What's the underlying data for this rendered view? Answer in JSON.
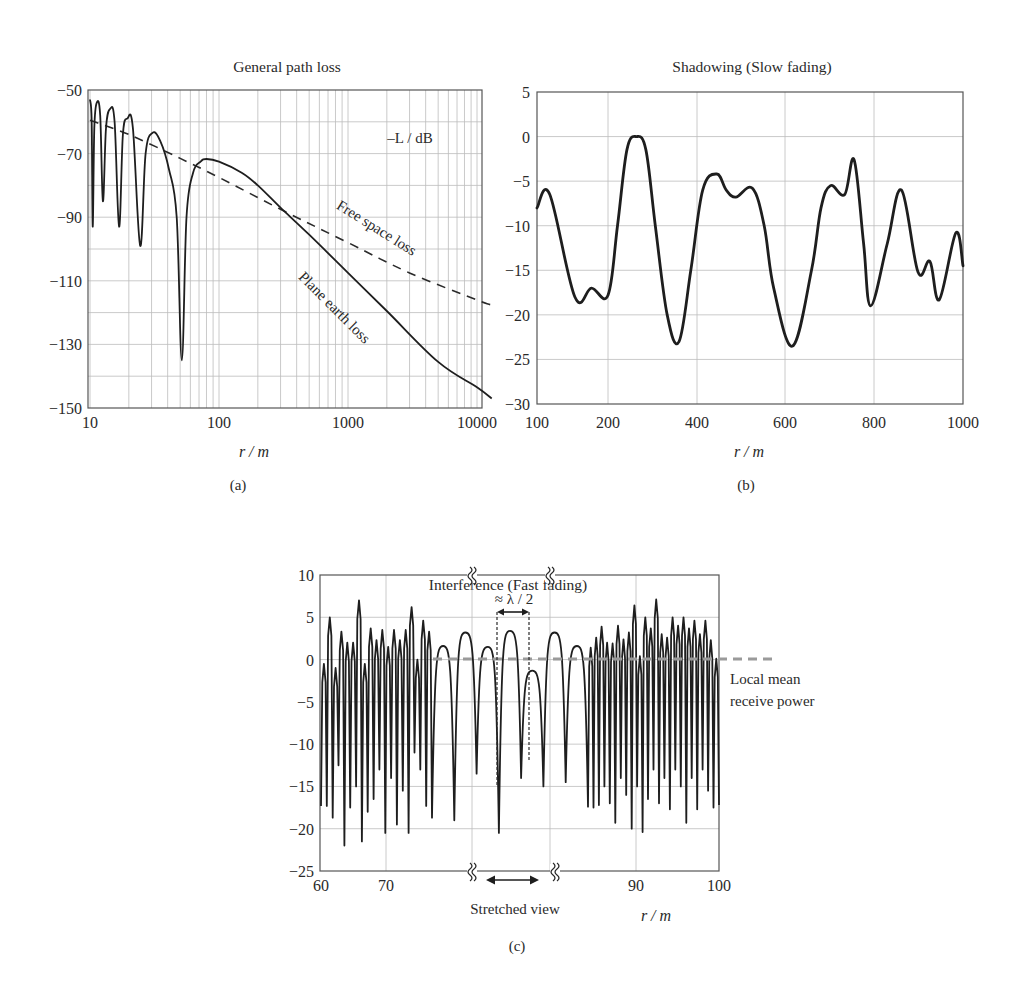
{
  "figure": {
    "panels": [
      "(a)",
      "(b)",
      "(c)"
    ]
  },
  "panel_a": {
    "title": "General path loss",
    "ylabel_annot": "–L / dB",
    "xlabel": "r / m",
    "caption": "(a)",
    "yticks": [
      "−50",
      "−70",
      "−90",
      "−110",
      "−130",
      "−150"
    ],
    "xticks": [
      "10",
      "100",
      "1000",
      "10000"
    ],
    "label_free_space": "Free space loss",
    "label_plane_earth": "Plane earth loss"
  },
  "panel_b": {
    "title": "Shadowing (Slow fading)",
    "xlabel": "r / m",
    "caption": "(b)",
    "yticks": [
      "5",
      "0",
      "−5",
      "−10",
      "−15",
      "−20",
      "−25",
      "−30"
    ],
    "xticks": [
      "100",
      "200",
      "400",
      "600",
      "800",
      "1000"
    ]
  },
  "panel_c": {
    "title": "Interference (Fast fading)",
    "xlabel": "r / m",
    "caption": "(c)",
    "yticks": [
      "10",
      "5",
      "0",
      "−5",
      "−10",
      "−15",
      "−20",
      "−25"
    ],
    "xticks": [
      "60",
      "70",
      "90",
      "100"
    ],
    "lambda_label": "≈ λ / 2",
    "mean_label_line1": "Local mean",
    "mean_label_line2": "receive power",
    "stretched_label": "Stretched view",
    "break_glyph": "≈"
  },
  "chart_data": [
    {
      "type": "line",
      "title": "General path loss",
      "xlabel": "r / m",
      "ylabel": "–L / dB",
      "xscale": "log",
      "xlim": [
        10,
        13000
      ],
      "ylim": [
        -150,
        -50
      ],
      "grid": true,
      "xticks": [
        10,
        100,
        1000,
        10000
      ],
      "yticks": [
        -50,
        -70,
        -90,
        -110,
        -130,
        -150
      ],
      "series": [
        {
          "name": "Plane earth loss",
          "style": "solid",
          "points": [
            [
              10.0,
              -53
            ],
            [
              10.3,
              -60
            ],
            [
              10.5,
              -93
            ],
            [
              10.8,
              -62
            ],
            [
              11.3,
              -54
            ],
            [
              12.0,
              -58
            ],
            [
              12.6,
              -85
            ],
            [
              13.3,
              -62
            ],
            [
              14.3,
              -56
            ],
            [
              15.5,
              -60
            ],
            [
              16.8,
              -93
            ],
            [
              18.0,
              -64
            ],
            [
              19.5,
              -59
            ],
            [
              21.5,
              -62
            ],
            [
              24.5,
              -99
            ],
            [
              27.0,
              -70
            ],
            [
              30.5,
              -63.5
            ],
            [
              35,
              -66
            ],
            [
              41,
              -75
            ],
            [
              47,
              -90
            ],
            [
              51.5,
              -135
            ],
            [
              56,
              -90
            ],
            [
              63,
              -76
            ],
            [
              72,
              -72.5
            ],
            [
              80,
              -71.7
            ],
            [
              100,
              -72.5
            ],
            [
              150,
              -76
            ],
            [
              200,
              -80
            ],
            [
              300,
              -87
            ],
            [
              500,
              -95.5
            ],
            [
              1000,
              -107.5
            ],
            [
              2000,
              -119.5
            ],
            [
              5000,
              -135.5
            ],
            [
              10000,
              -143.5
            ],
            [
              13000,
              -147
            ]
          ]
        },
        {
          "name": "Free space loss",
          "style": "dashed",
          "points": [
            [
              10,
              -59.5
            ],
            [
              20,
              -64
            ],
            [
              50,
              -71.5
            ],
            [
              100,
              -77.5
            ],
            [
              300,
              -87.5
            ],
            [
              1000,
              -98
            ],
            [
              3000,
              -107.5
            ],
            [
              10000,
              -116
            ],
            [
              13000,
              -117.6
            ]
          ]
        }
      ],
      "annotations": [
        "–L / dB",
        "Free space loss",
        "Plane earth loss"
      ]
    },
    {
      "type": "line",
      "title": "Shadowing (Slow fading)",
      "xlabel": "r / m",
      "ylabel": "",
      "xlim": [
        100,
        1000
      ],
      "ylim": [
        -30,
        5
      ],
      "grid": true,
      "xticks": [
        100,
        200,
        400,
        600,
        800,
        1000
      ],
      "yticks": [
        5,
        0,
        -5,
        -10,
        -15,
        -20,
        -25,
        -30
      ],
      "series": [
        {
          "name": "shadowing",
          "points": [
            [
              100,
              -8
            ],
            [
              127,
              -6.5
            ],
            [
              180,
              -18
            ],
            [
              215,
              -17
            ],
            [
              250,
              -17.8
            ],
            [
              270,
              -10
            ],
            [
              290,
              -1.5
            ],
            [
              310,
              0
            ],
            [
              330,
              -1.5
            ],
            [
              350,
              -10
            ],
            [
              375,
              -20
            ],
            [
              400,
              -23
            ],
            [
              425,
              -15
            ],
            [
              450,
              -6
            ],
            [
              480,
              -4.2
            ],
            [
              500,
              -6
            ],
            [
              520,
              -6.8
            ],
            [
              555,
              -5.8
            ],
            [
              580,
              -10
            ],
            [
              600,
              -17
            ],
            [
              640,
              -23.5
            ],
            [
              680,
              -15
            ],
            [
              700,
              -8
            ],
            [
              720,
              -5.5
            ],
            [
              750,
              -6.5
            ],
            [
              770,
              -2.6
            ],
            [
              790,
              -12
            ],
            [
              805,
              -19
            ],
            [
              840,
              -12
            ],
            [
              870,
              -6
            ],
            [
              905,
              -15.2
            ],
            [
              930,
              -14
            ],
            [
              950,
              -18.3
            ],
            [
              985,
              -10.8
            ],
            [
              1000,
              -14.5
            ]
          ]
        }
      ]
    },
    {
      "type": "line",
      "title": "Interference (Fast fading)",
      "xlabel": "r / m",
      "ylabel": "",
      "xlim": [
        60,
        100
      ],
      "ylim": [
        -25,
        10
      ],
      "grid": true,
      "xticks": [
        60,
        70,
        90,
        100
      ],
      "yticks": [
        10,
        5,
        0,
        -5,
        -10,
        -15,
        -20,
        -25
      ],
      "axis_break": "between ~75.5 m and ~81.5 m the x-axis is stretched (Stretched view)",
      "local_mean_dB": 0,
      "annotations": [
        "≈ λ / 2",
        "Local mean receive power",
        "Stretched view"
      ],
      "series": [
        {
          "name": "received power (dB)",
          "peaks_left_dense": [
            -0.5,
            5,
            -1,
            3.3,
            2,
            2,
            7,
            -0.5,
            3.7,
            2.3,
            3.5,
            1.5,
            3.5,
            2.3,
            3.5,
            6.2,
            0,
            4.6,
            3.3
          ],
          "troughs_left_dense": [
            -17.3,
            -18.7,
            -12.5,
            -22,
            -17.5,
            -15,
            -21.5,
            -18,
            -16.5,
            -13,
            -20.5,
            -14,
            -19.5,
            -15.5,
            -20.5,
            -11,
            -13
          ],
          "stretched_peaks": [
            1.6,
            3.2,
            1.5,
            3.4,
            -1.3,
            3.2,
            1.6
          ],
          "stretched_troughs": [
            -19,
            -13.5,
            -20.5,
            -14,
            -15,
            -14.5,
            -17.4
          ],
          "peaks_right_dense": [
            1.4,
            2.6,
            3.9,
            2,
            1.9,
            4,
            2.4,
            3.2,
            6.4,
            0.4,
            5,
            3.7,
            7.1,
            3,
            2.6,
            5,
            4,
            5,
            3.7,
            4.6,
            3,
            4.6,
            2.3,
            0.1
          ],
          "troughs_right_dense": [
            -17.5,
            -17.2,
            -15,
            -17,
            -19.3,
            -14,
            -16,
            -20,
            -15,
            -20.4,
            -16.5,
            -13,
            -17,
            -14,
            -17.7,
            -13,
            -15,
            -19.3,
            -14,
            -17.7,
            -13,
            -15.5
          ]
        }
      ]
    }
  ]
}
